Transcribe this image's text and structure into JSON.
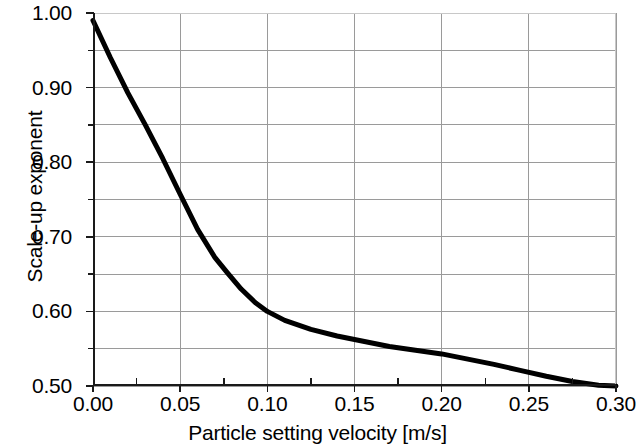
{
  "chart_data": {
    "type": "line",
    "title": "",
    "xlabel": "Particle setting velocity [m/s]",
    "ylabel": "Scale-up exponent",
    "xlim": [
      0.0,
      0.3
    ],
    "ylim": [
      0.5,
      1.0
    ],
    "x_major_ticks": [
      0.0,
      0.05,
      0.1,
      0.15,
      0.2,
      0.25,
      0.3
    ],
    "x_major_tick_labels": [
      "0.00",
      "0.05",
      "0.10",
      "0.15",
      "0.20",
      "0.25",
      "0.30"
    ],
    "x_minor_ticks": [
      0.025,
      0.075,
      0.125,
      0.175,
      0.225,
      0.275
    ],
    "y_major_ticks": [
      0.5,
      0.6,
      0.7,
      0.8,
      0.9,
      1.0
    ],
    "y_major_tick_labels": [
      "0.50",
      "0.60",
      "0.70",
      "0.80",
      "0.90",
      "1.00"
    ],
    "y_gridlines": [
      0.5,
      0.55,
      0.6,
      0.65,
      0.7,
      0.75,
      0.8,
      0.85,
      0.9,
      0.95,
      1.0
    ],
    "grid": "horizontal gridlines every 0.05; vertical gridlines at each major x tick",
    "legend": "none",
    "series": [
      {
        "name": "Scale-up exponent vs particle setting velocity",
        "color": "#000000",
        "line_width_px": 5,
        "x": [
          0.0,
          0.01,
          0.02,
          0.03,
          0.04,
          0.05,
          0.06,
          0.07,
          0.077,
          0.085,
          0.093,
          0.1,
          0.11,
          0.125,
          0.14,
          0.155,
          0.17,
          0.185,
          0.2,
          0.215,
          0.23,
          0.245,
          0.26,
          0.275,
          0.29,
          0.3
        ],
        "y": [
          0.99,
          0.94,
          0.893,
          0.85,
          0.805,
          0.757,
          0.71,
          0.672,
          0.652,
          0.63,
          0.612,
          0.6,
          0.588,
          0.576,
          0.567,
          0.56,
          0.553,
          0.548,
          0.543,
          0.536,
          0.529,
          0.521,
          0.513,
          0.506,
          0.501,
          0.5
        ]
      }
    ],
    "annotations": []
  },
  "axes": {
    "y_tick_labels": [
      "1.00",
      "0.90",
      "0.80",
      "0.70",
      "0.60",
      "0.50"
    ],
    "x_tick_labels": [
      "0.00",
      "0.05",
      "0.10",
      "0.15",
      "0.20",
      "0.25",
      "0.30"
    ],
    "x_title": "Particle setting velocity [m/s]",
    "y_title": "Scale-up exponent"
  },
  "colors": {
    "curve": "#000000",
    "gridline": "#9a9a9a",
    "axis_dark": "#1a1a1a",
    "frame_light": "#c8c8c8",
    "background": "#ffffff"
  }
}
